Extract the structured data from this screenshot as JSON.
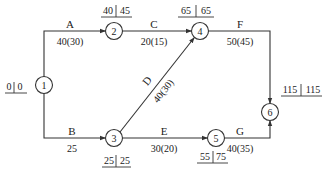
{
  "diagram": {
    "type": "activity-on-arrow network",
    "nodes": [
      {
        "id": "1",
        "label": "1",
        "es": "0",
        "lf": "0"
      },
      {
        "id": "2",
        "label": "2",
        "es": "40",
        "lf": "45"
      },
      {
        "id": "3",
        "label": "3",
        "es": "25",
        "lf": "25"
      },
      {
        "id": "4",
        "label": "4",
        "es": "65",
        "lf": "65"
      },
      {
        "id": "5",
        "label": "5",
        "es": "55",
        "lf": "75"
      },
      {
        "id": "6",
        "label": "6",
        "es": "115",
        "lf": "115"
      }
    ],
    "edges": [
      {
        "name": "A",
        "from": "1",
        "to": "2",
        "duration": "40(30)"
      },
      {
        "name": "B",
        "from": "1",
        "to": "3",
        "duration": "25"
      },
      {
        "name": "C",
        "from": "2",
        "to": "4",
        "duration": "20(15)"
      },
      {
        "name": "D",
        "from": "3",
        "to": "4",
        "duration": "40(30)"
      },
      {
        "name": "E",
        "from": "3",
        "to": "5",
        "duration": "30(20)"
      },
      {
        "name": "F",
        "from": "4",
        "to": "6",
        "duration": "50(45)"
      },
      {
        "name": "G",
        "from": "5",
        "to": "6",
        "duration": "40(35)"
      }
    ]
  }
}
